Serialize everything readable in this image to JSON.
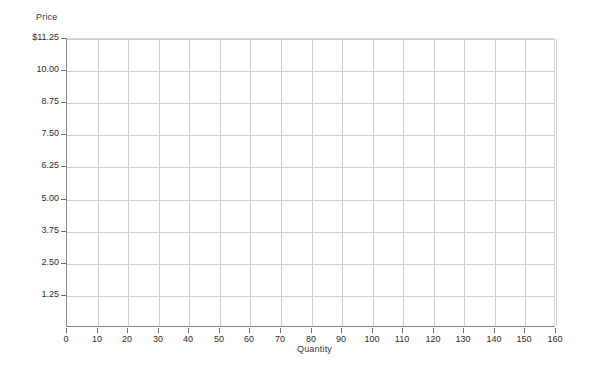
{
  "chart_data": {
    "type": "line",
    "title": "",
    "subtitle": "",
    "xlabel": "Quantity",
    "ylabel": "Price",
    "xlim": [
      0,
      160
    ],
    "ylim": [
      0,
      11.25
    ],
    "x_tick_labels": [
      "0",
      "10",
      "20",
      "30",
      "40",
      "50",
      "60",
      "70",
      "80",
      "90",
      "100",
      "110",
      "120",
      "130",
      "140",
      "150",
      "160"
    ],
    "x_tick_values": [
      0,
      10,
      20,
      30,
      40,
      50,
      60,
      70,
      80,
      90,
      100,
      110,
      120,
      130,
      140,
      150,
      160
    ],
    "y_tick_labels": [
      "1.25",
      "2.50",
      "3.75",
      "5.00",
      "6.25",
      "7.50",
      "8.75",
      "10.00",
      "$11.25"
    ],
    "y_tick_values": [
      1.25,
      2.5,
      3.75,
      5.0,
      6.25,
      7.5,
      8.75,
      10.0,
      11.25
    ],
    "grid": true,
    "grid_color": "#cfcfcf",
    "axis_color": "#8a8a8a",
    "legend": null,
    "legend_position": "none",
    "series": [],
    "annotations": []
  },
  "colors": {
    "background": "#ffffff",
    "grid": "#cfcfcf",
    "axis": "#8a8a8a",
    "tick": "#6f6f6f",
    "text": "#2e2e2e"
  }
}
